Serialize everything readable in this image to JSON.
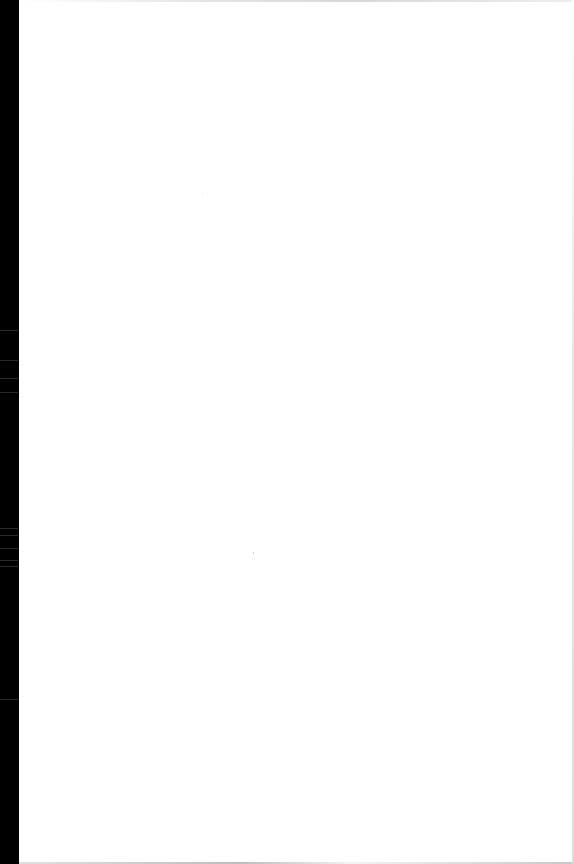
{
  "document": {
    "type": "scanned-page",
    "content": "",
    "background_color": "#ffffff",
    "scanner_edge_color": "#000000"
  }
}
